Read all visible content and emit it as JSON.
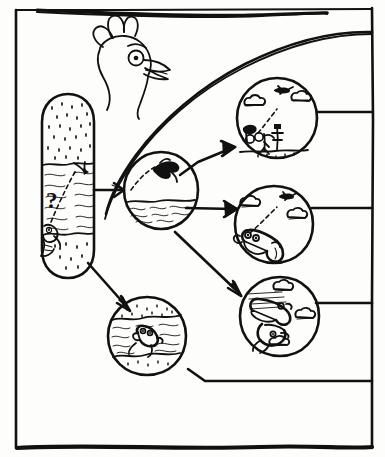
{
  "figure": {
    "caption_symbol": "?",
    "style": "black ink line drawing on white paper",
    "ink_color": "#111111",
    "paper_color": "#fdfdfb"
  },
  "frame": {
    "name": "outer-panel-border",
    "top_rule_label": "",
    "border_color": "#111111"
  },
  "mascot": {
    "name": "chicken-head",
    "label": "",
    "parts": [
      "comb",
      "eye",
      "beak",
      "wattle",
      "neck"
    ]
  },
  "source_node": {
    "name": "origin-capsule",
    "label": "",
    "question_mark": "?",
    "layers": [
      "stippled-sand-top",
      "wavy-water-middle",
      "stippled-sand-bottom"
    ],
    "creature": "small-fish-creature",
    "trajectory": "dashed-ascending-path"
  },
  "nodes": [
    {
      "id": "center",
      "name": "scene-diving",
      "label": "",
      "contents": [
        "leaping-creature",
        "dashed-arc-trajectory",
        "wavy-water-surface"
      ],
      "scene_type": "water-leap"
    },
    {
      "id": "upper_right",
      "name": "scene-launch",
      "label": "",
      "contents": [
        "flying-plane",
        "clouds",
        "launch-figures",
        "ground-line"
      ],
      "scene_type": "air-launch"
    },
    {
      "id": "mid_right",
      "name": "scene-glide",
      "label": "",
      "contents": [
        "flying-plane",
        "clouds",
        "dashed-glide-path",
        "large-creature"
      ],
      "scene_type": "air-glide"
    },
    {
      "id": "lower_right",
      "name": "scene-flight",
      "label": "",
      "contents": [
        "flying-creature",
        "speed-lines",
        "clouds"
      ],
      "scene_type": "powered-flight"
    },
    {
      "id": "bottom_center",
      "name": "scene-swim",
      "label": "",
      "contents": [
        "swimming-creature",
        "wavy-water",
        "stippled-banks"
      ],
      "scene_type": "underwater-swim"
    }
  ],
  "connectors": [
    {
      "name": "arrow-origin-to-center",
      "from": "origin-capsule",
      "to": "center",
      "style": "solid-arrow"
    },
    {
      "name": "arrow-origin-to-bottom-center",
      "from": "origin-capsule",
      "to": "bottom_center",
      "style": "solid-arrow"
    },
    {
      "name": "arrow-center-to-upper-right",
      "from": "center",
      "to": "upper_right",
      "style": "solid-arrow"
    },
    {
      "name": "arrow-center-to-mid-right",
      "from": "center",
      "to": "mid_right",
      "style": "solid-arrow"
    },
    {
      "name": "arrow-center-to-lower-right",
      "from": "center",
      "to": "lower_right",
      "style": "solid-arrow"
    }
  ],
  "background_strokes": {
    "name": "sweeping-curve-and-rails",
    "curve_label": "",
    "rail_count": 3
  }
}
